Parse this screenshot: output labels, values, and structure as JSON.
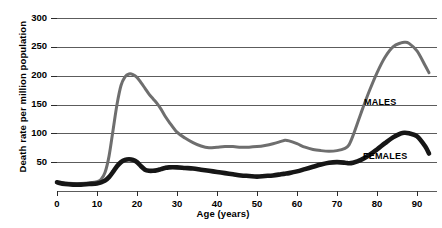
{
  "chart_data": {
    "type": "line",
    "title": "",
    "subtitle": "",
    "xlabel": "Age (years)",
    "ylabel": "Death rate per million population",
    "xlim": [
      0,
      95
    ],
    "ylim": [
      0,
      300
    ],
    "grid": true,
    "grid_axis": "y",
    "legend_position": "inline-annotation",
    "xticks": [
      "0",
      "10",
      "20",
      "30",
      "40",
      "50",
      "60",
      "70",
      "80",
      "90"
    ],
    "xtick_values": [
      0,
      10,
      20,
      30,
      40,
      50,
      60,
      70,
      80,
      90
    ],
    "yticks": [
      "50",
      "100",
      "150",
      "200",
      "250",
      "300"
    ],
    "ytick_values": [
      50,
      100,
      150,
      200,
      250,
      300
    ],
    "x": [
      0,
      2,
      4,
      6,
      8,
      10,
      11,
      12,
      13,
      14,
      15,
      16,
      17,
      18,
      19,
      20,
      21,
      22,
      23,
      24,
      25,
      26,
      27,
      28,
      30,
      32,
      34,
      36,
      38,
      40,
      42,
      44,
      46,
      48,
      50,
      52,
      54,
      56,
      57,
      58,
      60,
      62,
      64,
      66,
      68,
      70,
      72,
      73,
      74,
      76,
      78,
      80,
      82,
      84,
      86,
      87,
      88,
      90,
      92,
      93
    ],
    "series": [
      {
        "name": "MALES",
        "color": "#6e6e6e",
        "line_width": 3.0,
        "values": [
          16,
          14,
          13,
          13,
          14,
          16,
          20,
          32,
          60,
          105,
          150,
          183,
          198,
          203,
          202,
          197,
          188,
          178,
          168,
          160,
          152,
          142,
          130,
          120,
          102,
          92,
          84,
          78,
          75,
          76,
          77,
          77,
          76,
          76,
          77,
          79,
          82,
          86,
          88,
          87,
          82,
          76,
          72,
          70,
          69,
          70,
          74,
          80,
          96,
          135,
          172,
          205,
          232,
          250,
          257,
          258,
          256,
          243,
          218,
          205
        ]
      },
      {
        "name": "FEMALES",
        "color": "#161616",
        "line_width": 4.6,
        "values": [
          15,
          12,
          11,
          11,
          12,
          13,
          15,
          18,
          24,
          33,
          43,
          50,
          54,
          55,
          54,
          50,
          43,
          37,
          35,
          35,
          36,
          38,
          40,
          41,
          41,
          40,
          39,
          37,
          35,
          33,
          31,
          29,
          27,
          26,
          25,
          26,
          27,
          29,
          30,
          31,
          34,
          38,
          42,
          46,
          49,
          50,
          49,
          48,
          49,
          54,
          62,
          72,
          83,
          93,
          100,
          101,
          100,
          95,
          78,
          65
        ]
      }
    ],
    "annotations": [
      {
        "text": "MALES",
        "x": 78,
        "y": 130
      },
      {
        "text": "FEMALES",
        "x": 78,
        "y": 38
      }
    ]
  }
}
